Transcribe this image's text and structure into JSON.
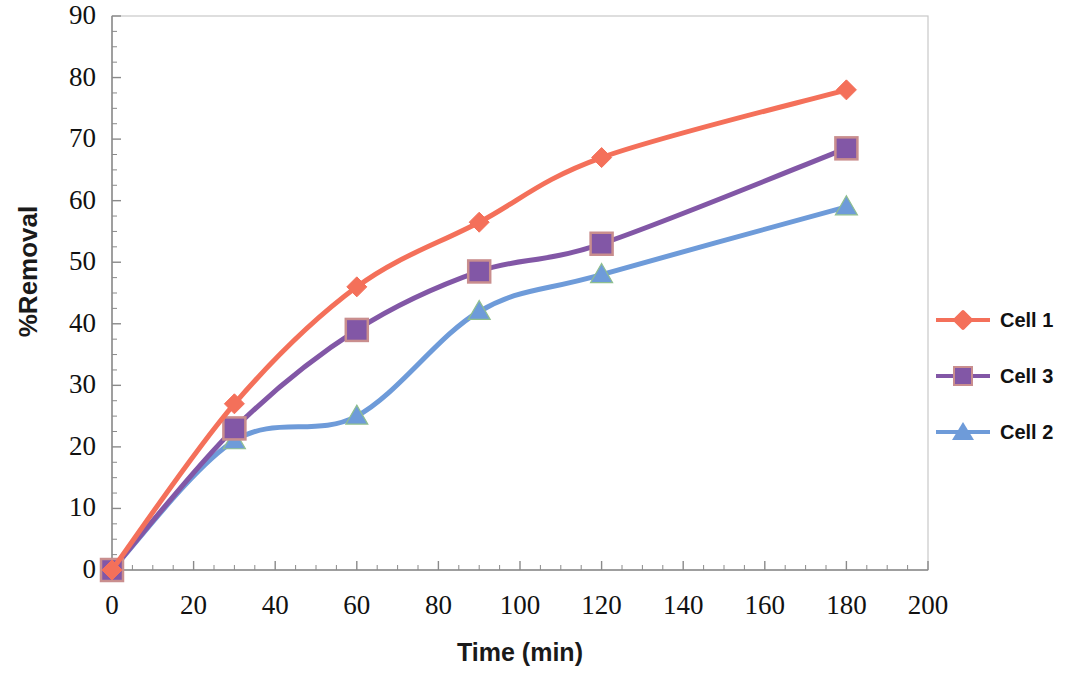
{
  "chart_data": {
    "type": "line",
    "title": "",
    "xlabel": "Time (min)",
    "ylabel": "%Removal",
    "xlim": [
      0,
      200
    ],
    "ylim": [
      0,
      90
    ],
    "x_ticks": [
      0,
      20,
      40,
      60,
      80,
      100,
      120,
      140,
      160,
      180,
      200
    ],
    "y_ticks": [
      0,
      10,
      20,
      30,
      40,
      50,
      60,
      70,
      80,
      90
    ],
    "x_minor_step": 5,
    "y_minor_step": 2.5,
    "grid": false,
    "legend_position": "right",
    "x": [
      0,
      30,
      60,
      90,
      120,
      180
    ],
    "series": [
      {
        "name": "Cell 1",
        "color": "#F4705A",
        "marker": "diamond",
        "values": [
          0,
          27,
          46,
          56.5,
          67,
          78
        ]
      },
      {
        "name": "Cell 3",
        "color": "#8257A6",
        "marker": "square",
        "values": [
          0,
          23,
          39,
          48.5,
          53,
          68.5
        ]
      },
      {
        "name": "Cell 2",
        "color": "#6E9BD9",
        "marker": "triangle",
        "values": [
          0,
          21,
          25,
          42,
          48,
          59
        ]
      }
    ]
  },
  "axes": {
    "y_label": "%Removal",
    "x_label": "Time (min)",
    "y_tick_labels": [
      "0",
      "10",
      "20",
      "30",
      "40",
      "50",
      "60",
      "70",
      "80",
      "90"
    ],
    "x_tick_labels": [
      "0",
      "20",
      "40",
      "60",
      "80",
      "100",
      "120",
      "140",
      "160",
      "180",
      "200"
    ]
  },
  "legend": {
    "entries": [
      {
        "label": "Cell 1",
        "color": "#F4705A",
        "marker": "diamond"
      },
      {
        "label": "Cell 3",
        "color": "#8257A6",
        "marker": "square"
      },
      {
        "label": "Cell 2",
        "color": "#6E9BD9",
        "marker": "triangle"
      }
    ]
  }
}
